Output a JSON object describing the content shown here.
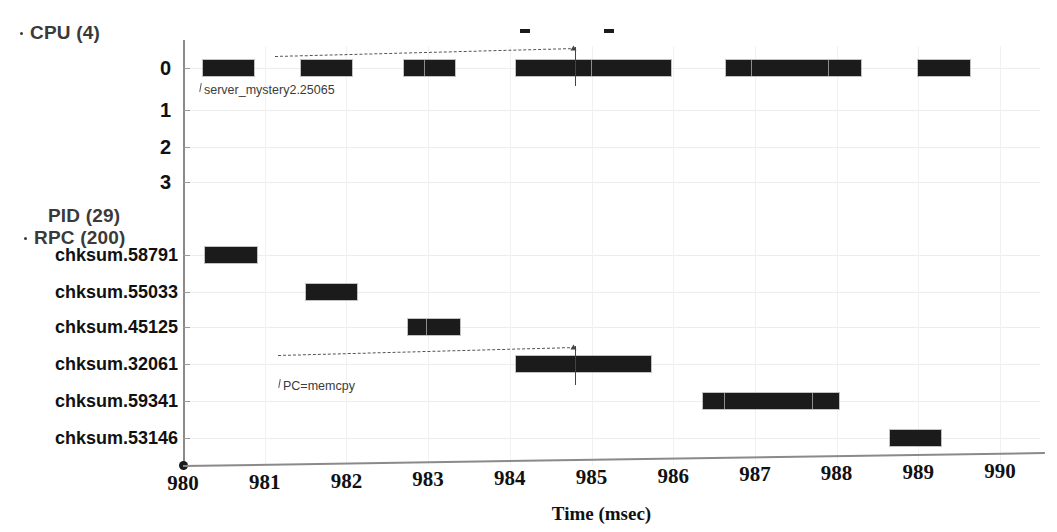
{
  "chart_data": {
    "type": "timeline",
    "title": "",
    "xlabel": "Time (msec)",
    "ylabel": "",
    "xlim": [
      980,
      990
    ],
    "xticks": [
      "980",
      "981",
      "982",
      "983",
      "984",
      "985",
      "986",
      "987",
      "988",
      "989",
      "990"
    ],
    "grid": true,
    "groups": [
      {
        "name": "cpu",
        "header": "CPU (4)",
        "bullet": true,
        "rows": [
          {
            "label": "0",
            "spans": [
              {
                "start": 980.25,
                "end": 980.87,
                "splits": []
              },
              {
                "start": 981.45,
                "end": 982.07,
                "splits": []
              },
              {
                "start": 982.7,
                "end": 983.33,
                "splits": [
                  982.95
                ]
              },
              {
                "start": 984.07,
                "end": 985.97,
                "splits": [
                  985.0
                ]
              },
              {
                "start": 986.65,
                "end": 988.3,
                "splits": [
                  986.95,
                  987.9
                ]
              },
              {
                "start": 989.0,
                "end": 989.63,
                "splits": []
              }
            ]
          },
          {
            "label": "1",
            "spans": []
          },
          {
            "label": "2",
            "spans": []
          },
          {
            "label": "3",
            "spans": []
          }
        ],
        "marks": [
          {
            "start": 984.13,
            "end": 984.25
          },
          {
            "start": 985.15,
            "end": 985.27
          }
        ]
      },
      {
        "name": "pid_rpc",
        "header_lines": [
          "PID (29)",
          "RPC (200)"
        ],
        "bullet": true,
        "rows": [
          {
            "label": "chksum.58791",
            "spans": [
              {
                "start": 980.27,
                "end": 980.9,
                "splits": []
              }
            ]
          },
          {
            "label": "chksum.55033",
            "spans": [
              {
                "start": 981.5,
                "end": 982.13,
                "splits": []
              }
            ]
          },
          {
            "label": "chksum.45125",
            "spans": [
              {
                "start": 982.75,
                "end": 983.39,
                "splits": [
                  982.98
                ]
              }
            ]
          },
          {
            "label": "chksum.32061",
            "spans": [
              {
                "start": 984.08,
                "end": 985.73,
                "splits": [
                  984.8
                ]
              }
            ]
          },
          {
            "label": "chksum.59341",
            "spans": [
              {
                "start": 986.36,
                "end": 988.03,
                "splits": [
                  986.62,
                  987.7
                ]
              }
            ]
          },
          {
            "label": "chksum.53146",
            "spans": [
              {
                "start": 988.65,
                "end": 989.28,
                "splits": []
              }
            ]
          }
        ]
      }
    ],
    "annotations": [
      {
        "id": "server-mystery",
        "text": "server_mystery2.25065",
        "line_start": 981.12,
        "line_end": 984.8,
        "target_row": "cpu-0"
      },
      {
        "id": "pc-memcpy",
        "text": "PC=memcpy",
        "line_start": 981.16,
        "line_end": 984.8,
        "target_row": "chksum.32061"
      }
    ],
    "colors": {
      "bar": "#1b1b1b",
      "axis": "#8a8a8a",
      "grid": "#ededed",
      "label": "#111111",
      "header": "#3a3a3a",
      "annotation": "#3b3b3b"
    }
  }
}
